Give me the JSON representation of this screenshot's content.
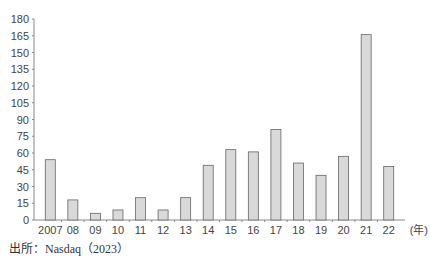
{
  "chart_data": {
    "type": "bar",
    "title": "",
    "xlabel": "(年)",
    "ylabel": "",
    "ylim": [
      0,
      180
    ],
    "yticks": [
      0,
      15,
      30,
      45,
      60,
      75,
      90,
      105,
      120,
      135,
      150,
      165,
      180
    ],
    "grid": false,
    "legend": null,
    "categories": [
      "2007",
      "08",
      "09",
      "10",
      "11",
      "12",
      "13",
      "14",
      "15",
      "16",
      "17",
      "18",
      "19",
      "20",
      "21",
      "22"
    ],
    "values": [
      54,
      18,
      6,
      9,
      20,
      9,
      20,
      49,
      63,
      61,
      81,
      51,
      40,
      57,
      166,
      48
    ],
    "bar_fill": "#d9d9d9",
    "bar_stroke": "#666666",
    "axis_color": "#888888"
  },
  "source": "出所：Nasdaq（2023）"
}
